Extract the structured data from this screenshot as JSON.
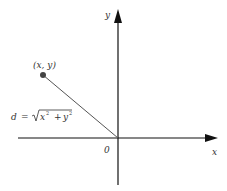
{
  "diagram": {
    "axes": {
      "x_label": "x",
      "y_label": "y",
      "origin_label": "0"
    },
    "point": {
      "label": "(x, y)"
    },
    "distance": {
      "lhs": "d",
      "eq": "=",
      "radicand_x": "x",
      "radicand_y": "y",
      "exponent": "2",
      "plus": "+"
    },
    "colors": {
      "axis": "#111111",
      "line": "#555555",
      "point": "#444444"
    }
  }
}
